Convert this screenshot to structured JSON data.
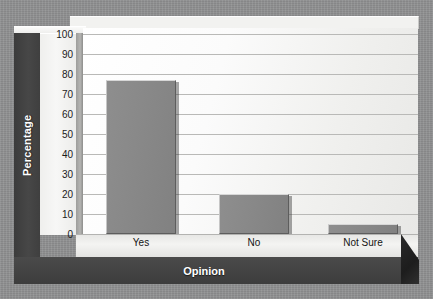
{
  "chart_data": {
    "type": "bar",
    "title": "",
    "xlabel": "Opinion",
    "ylabel": "Percentage",
    "categories": [
      "Yes",
      "No",
      "Not Sure"
    ],
    "values": [
      77,
      20,
      5
    ],
    "ylim": [
      0,
      100
    ],
    "yticks": [
      100,
      90,
      80,
      70,
      60,
      50,
      40,
      30,
      20,
      10,
      0
    ],
    "grid": true,
    "legend": "none",
    "series": [
      {
        "name": "Percentage",
        "values": [
          77,
          20,
          5
        ]
      }
    ],
    "colors": {
      "bar_fill": "#898989",
      "plot_background": "#fbfbfb",
      "gridline": "#b9b9b7",
      "axis_band": "#444444",
      "axis_title_text": "#ffffff",
      "page_background": "#8f9091"
    }
  },
  "axes": {
    "y_title": "Percentage",
    "x_title": "Opinion",
    "y_ticks": [
      "100",
      "90",
      "80",
      "70",
      "60",
      "50",
      "40",
      "30",
      "20",
      "10",
      "0"
    ],
    "x_ticks": [
      "Yes",
      "No",
      "Not Sure"
    ]
  }
}
